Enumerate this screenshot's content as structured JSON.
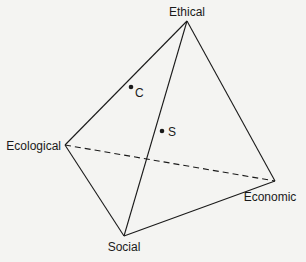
{
  "diagram": {
    "type": "tetrahedron",
    "vertices": {
      "ethical": {
        "label": "Ethical",
        "x": 187,
        "y": 21
      },
      "ecological": {
        "label": "Ecological",
        "x": 65,
        "y": 145
      },
      "economic": {
        "label": "Economic",
        "x": 275,
        "y": 181
      },
      "social": {
        "label": "Social",
        "x": 124,
        "y": 236
      }
    },
    "points": {
      "c": {
        "label": "C",
        "x": 131,
        "y": 87
      },
      "s": {
        "label": "S",
        "x": 162,
        "y": 131
      }
    },
    "edges": [
      {
        "from": "ethical",
        "to": "ecological",
        "style": "solid"
      },
      {
        "from": "ethical",
        "to": "economic",
        "style": "solid"
      },
      {
        "from": "ethical",
        "to": "social",
        "style": "solid"
      },
      {
        "from": "ecological",
        "to": "social",
        "style": "solid"
      },
      {
        "from": "social",
        "to": "economic",
        "style": "solid"
      },
      {
        "from": "ecological",
        "to": "economic",
        "style": "dashed"
      }
    ],
    "colors": {
      "line": "#1a1a1a",
      "background": "#f4f4f2"
    }
  }
}
